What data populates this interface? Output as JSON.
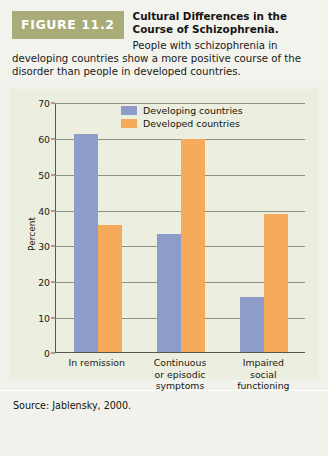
{
  "figure": {
    "tag": "FIGURE 11.2",
    "title_line1": "Cultural Differences in the",
    "title_line2": "Course of Schizophrenia.",
    "caption_line1": "People with schizophrenia in",
    "caption_line2": "developing countries show a more positive course of the",
    "caption_line3": "disorder than people in developed countries.",
    "source": "Source: Jablensky, 2000."
  },
  "colors": {
    "developing": "#8e9cc9",
    "developed": "#f6ab5c",
    "tag_band": "#a9ac78",
    "panel_background": "#eceee0",
    "card_background": "#f2f2ec",
    "gridline": "#8e9184",
    "axis": "#55584c"
  },
  "chart_data": {
    "type": "bar",
    "title": "Cultural Differences in the Course of Schizophrenia.",
    "xlabel": "",
    "ylabel": "Percent",
    "ylim": [
      0,
      70
    ],
    "yticks": [
      0,
      10,
      20,
      30,
      40,
      50,
      60,
      70
    ],
    "ytick_labels": [
      "0",
      "10",
      "20",
      "30",
      "40",
      "50",
      "60",
      "70"
    ],
    "grid": true,
    "legend_position": "top-center",
    "categories": [
      "In remission",
      "Continuous or episodic symptoms",
      "Impaired social functioning"
    ],
    "category_lines": [
      [
        "In remission"
      ],
      [
        "Continuous",
        "or episodic",
        "symptoms"
      ],
      [
        "Impaired",
        "social",
        "functioning"
      ]
    ],
    "series": [
      {
        "name": "Developing countries",
        "color": "#8e9cc9",
        "values": [
          61.5,
          33.3,
          15.5
        ]
      },
      {
        "name": "Developed countries",
        "color": "#f6ab5c",
        "values": [
          35.7,
          60.0,
          38.8
        ]
      }
    ]
  }
}
